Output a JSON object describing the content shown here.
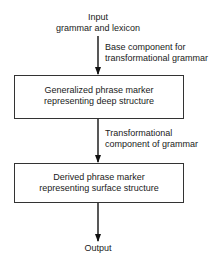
{
  "diagram": {
    "input": {
      "line1": "Input",
      "line2": "grammar and lexicon"
    },
    "edge1": {
      "line1": "Base component for",
      "line2": "transformational grammar"
    },
    "box1": {
      "line1": "Generalized phrase marker",
      "line2": "representing deep structure"
    },
    "edge2": {
      "line1": "Transformational",
      "line2": "component of grammar"
    },
    "box2": {
      "line1": "Derived phrase marker",
      "line2": "representing surface structure"
    },
    "output": {
      "label": "Output"
    }
  }
}
